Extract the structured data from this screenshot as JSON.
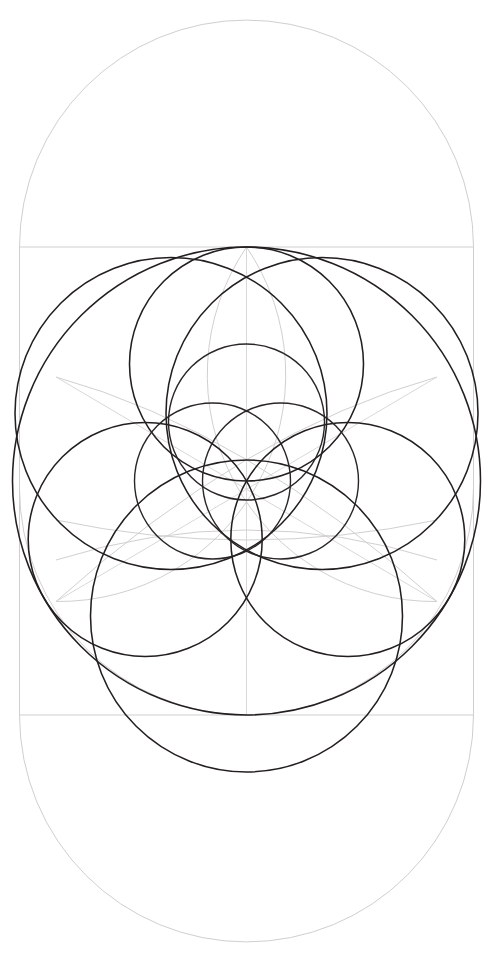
{
  "figure": {
    "canvas": {
      "width": 492,
      "height": 973,
      "background": "#ffffff"
    },
    "colors": {
      "ink": "#231f20",
      "guide": "#cfcfcf",
      "guide_faint": "#d8d8d8",
      "background": "#ffffff"
    },
    "center": {
      "x": 246.5,
      "y": 481
    },
    "stadium": {
      "name": "outer-stadium",
      "left": 19.5,
      "right": 473.5,
      "top_cap_center_y": 247,
      "bottom_cap_center_y": 715,
      "cap_radius": 227,
      "stroke": "#cfcfcf"
    },
    "square_frame": {
      "name": "guide-square",
      "x": 19.5,
      "y": 247,
      "width": 454,
      "height": 468,
      "stroke": "#cfcfcf"
    },
    "axis_lines": [
      {
        "name": "vertical-center-axis",
        "x1": 246.5,
        "y1": 247,
        "x2": 246.5,
        "y2": 715
      },
      {
        "name": "horizontal-top-edge",
        "x1": 19.5,
        "y1": 247,
        "x2": 473.5,
        "y2": 247
      },
      {
        "name": "horizontal-bottom-edge",
        "x1": 19.5,
        "y1": 715,
        "x2": 473.5,
        "y2": 715
      }
    ],
    "black_circles": [
      {
        "name": "outer-great-circle",
        "cx": 246.5,
        "cy": 481,
        "r": 234
      },
      {
        "name": "petal-circle-top",
        "cx": 246.5,
        "cy": 364,
        "r": 117
      },
      {
        "name": "petal-circle-lower-left",
        "cx": 145.2,
        "cy": 539.5,
        "r": 117
      },
      {
        "name": "petal-circle-lower-right",
        "cx": 347.8,
        "cy": 539.5,
        "r": 117
      },
      {
        "name": "lens-circle-upper-left",
        "cx": 171.0,
        "cy": 413.5,
        "r": 137
      },
      {
        "name": "lens-circle-upper-right",
        "cx": 322.0,
        "cy": 413.5,
        "r": 137
      },
      {
        "name": "lens-circle-bottom",
        "cx": 246.5,
        "cy": 616,
        "r": 137
      },
      {
        "name": "inner-circle-left",
        "cx": 212.5,
        "cy": 481,
        "r": 78
      },
      {
        "name": "inner-circle-right",
        "cx": 280.5,
        "cy": 481,
        "r": 78
      },
      {
        "name": "inner-circle-top",
        "cx": 246.5,
        "cy": 422,
        "r": 78
      }
    ],
    "guide_arcs": [
      {
        "name": "guide-arc-left-sweep",
        "cx": 19.5,
        "cy": 247,
        "r": 227
      },
      {
        "name": "guide-arc-right-sweep",
        "cx": 473.5,
        "cy": 247,
        "r": 227
      },
      {
        "name": "guide-arc-bottom-left-sweep",
        "cx": 19.5,
        "cy": 715,
        "r": 227
      },
      {
        "name": "guide-arc-bottom-right-sweep",
        "cx": 473.5,
        "cy": 715,
        "r": 227
      }
    ],
    "guide_diagonals": [
      {
        "name": "guide-diagonal-rising",
        "x1": 56.0,
        "y1": 601.5,
        "x2": 437.0,
        "y2": 377.0
      },
      {
        "name": "guide-diagonal-falling",
        "x1": 56.0,
        "y1": 377.0,
        "x2": 437.0,
        "y2": 601.5
      }
    ],
    "node_points": [
      {
        "name": "node-center",
        "x": 246.5,
        "y": 481
      },
      {
        "name": "node-top-tangent",
        "x": 246.5,
        "y": 247
      },
      {
        "name": "node-bottom-tangent",
        "x": 246.5,
        "y": 715
      },
      {
        "name": "node-left",
        "x": 56.0,
        "y": 601.5
      },
      {
        "name": "node-right",
        "x": 437.0,
        "y": 601.5
      }
    ]
  }
}
